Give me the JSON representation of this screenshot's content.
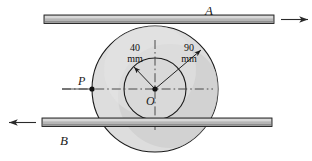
{
  "figure": {
    "type": "mechanics-diagram",
    "background_color": "#ffffff",
    "outline_color": "#1a1a1a",
    "disk_fill": "#dcdcdc",
    "disk_shade_fill": "#c9c9c9",
    "bar_fill": "#b5b5b5",
    "bar_highlight": "#d6d6d6"
  },
  "labels": {
    "bar_a": "A",
    "bar_b": "B",
    "point_p": "P",
    "center_o": "O"
  },
  "dimensions": [
    {
      "id": "inner-radius",
      "value": "40",
      "unit": "mm"
    },
    {
      "id": "outer-radius",
      "value": "90",
      "unit": "mm"
    }
  ],
  "geometry": {
    "center": {
      "x": 155,
      "y": 89
    },
    "outer_radius_px": 63,
    "inner_radius_px": 31,
    "point_p": {
      "x": 92,
      "y": 89
    },
    "bar_a": {
      "x1": 44,
      "x2": 274,
      "y": 19,
      "thickness": 8,
      "arrow_direction": "right"
    },
    "bar_b": {
      "x1": 42,
      "x2": 272,
      "y": 122,
      "thickness": 8,
      "arrow_direction": "left"
    }
  },
  "arrows": {
    "bar_a_motion": "right",
    "bar_b_motion": "left",
    "inner_radius_arrow": "up-left",
    "outer_radius_arrow": "up-right"
  }
}
